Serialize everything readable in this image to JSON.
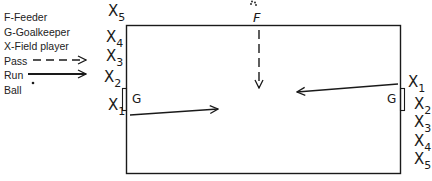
{
  "legend": {
    "feeder": "F-Feeder",
    "goalkeeper": "G-Goalkeeper",
    "field_player": "X-Field player",
    "pass": "Pass",
    "run": "Run",
    "ball": "Ball"
  },
  "feeder_label": "F",
  "left_goalkeeper": "G",
  "right_goalkeeper": "G",
  "left_players": [
    {
      "letter": "X",
      "num": "5"
    },
    {
      "letter": "X",
      "num": "4"
    },
    {
      "letter": "X",
      "num": "3"
    },
    {
      "letter": "X",
      "num": "2"
    },
    {
      "letter": "X",
      "num": "1"
    }
  ],
  "right_players": [
    {
      "letter": "X",
      "num": "1"
    },
    {
      "letter": "X",
      "num": "2"
    },
    {
      "letter": "X",
      "num": "3"
    },
    {
      "letter": "X",
      "num": "4"
    },
    {
      "letter": "X",
      "num": "5"
    }
  ],
  "colors": {
    "ink": "#1a1a1a",
    "background": "#ffffff"
  }
}
